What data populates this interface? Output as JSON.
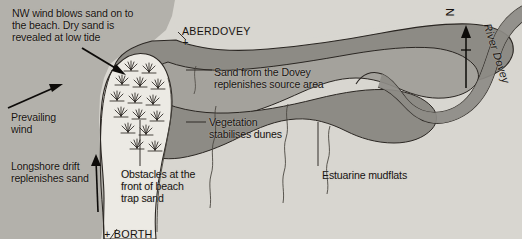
{
  "palette": {
    "background": "#ffffff",
    "sea": "#b3b1ab",
    "land": "#d8d6d0",
    "estuary_dark": "#8d8b85",
    "estuary_mid": "#a4a29c",
    "dune_light": "#eceae4",
    "outline": "#2a2622",
    "text": "#16120f"
  },
  "labels": {
    "intro": "NW wind blows sand on to\nthe beach. Dry sand is\nrevealed at low tide",
    "prevailing_wind": "Prevailing\nwind",
    "longshore_drift": "Longshore drift\nreplenishes sand",
    "obstacles": "Obstacles at the\nfront of beach\ntrap sand",
    "borth": "+ BORTH",
    "aberdovey": "ABERDOVEY",
    "aberdovey_marker": "+",
    "sand_from_dovey": "Sand from the Dovey\nreplenishes source area",
    "vegetation": "Vegetation\nstabilises dunes",
    "estuarine_mudflats": "Estuarine mudflats",
    "north": "N",
    "river": "River Dovey"
  },
  "icons": {
    "north_arrow": "north-arrow-icon",
    "wind_arrow": "wind-direction-arrow-icon",
    "drift_arrow": "longshore-drift-arrow-icon",
    "settlement_marker": "settlement-cross-marker-icon",
    "dune_grass": "marram-grass-tuft-icon"
  }
}
